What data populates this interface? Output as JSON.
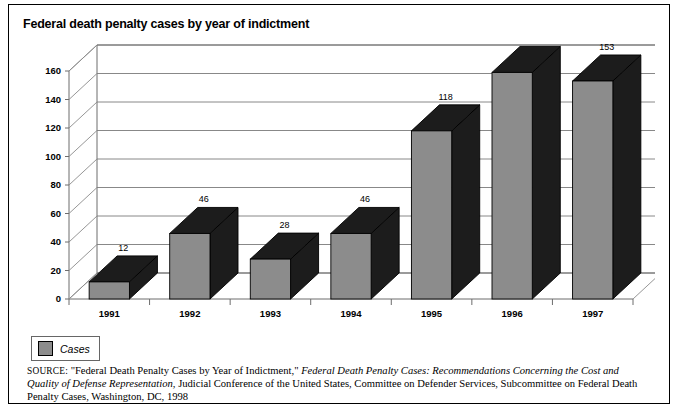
{
  "figure": {
    "title": "Federal death penalty cases by year of indictment"
  },
  "legend": {
    "label": "Cases"
  },
  "source": {
    "keyword": "SOURCE:",
    "quoted_title": "\"Federal Death Penalty Cases by Year of Indictment,\"",
    "italic_title": "Federal Death Penalty Cases: Recommendations Concerning the Cost and Quality of Defense Representation",
    "rest": ", Judicial Conference of the United States, Committee on Defender Services, Subcommittee on Federal Death Penalty Cases, Washington, DC, 1998"
  },
  "chart_data": {
    "type": "bar",
    "title": "Federal death penalty cases by year of indictment",
    "xlabel": "",
    "ylabel": "",
    "categories": [
      "1991",
      "1992",
      "1993",
      "1994",
      "1995",
      "1996",
      "1997"
    ],
    "values": [
      12,
      46,
      28,
      46,
      118,
      159,
      153
    ],
    "series": [
      {
        "name": "Cases",
        "values": [
          12,
          46,
          28,
          46,
          118,
          159,
          153
        ]
      }
    ],
    "ylim": [
      0,
      160
    ],
    "yticks": [
      0,
      20,
      40,
      60,
      80,
      100,
      120,
      140,
      160
    ],
    "ytick_labels": [
      "0",
      "20",
      "40",
      "60",
      "80",
      "100",
      "120",
      "140",
      "160"
    ],
    "grid": true,
    "grid_axis": "y",
    "legend_position": "below-left",
    "three_d": true,
    "colors": {
      "bar_front": "#8c8c8c",
      "bar_top": "#1c1c1c",
      "bar_side": "#1c1c1c",
      "gridline": "#7a7a7a",
      "axis": "#6d6d6d",
      "text": "#000000",
      "background": "#ffffff"
    },
    "data_labels": [
      "12",
      "46",
      "28",
      "46",
      "118",
      "159",
      "153"
    ]
  }
}
